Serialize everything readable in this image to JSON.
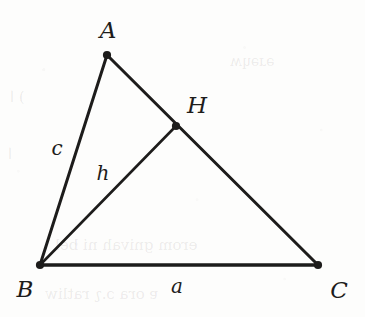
{
  "figure": {
    "kind": "geometry-diagram",
    "background_color": "#fdfdfc",
    "ink_color": "#1d1c1b",
    "width": 365,
    "height": 317
  },
  "points": {
    "A": {
      "label": "A",
      "x": 107,
      "y": 55,
      "label_x": 108,
      "label_y": 30
    },
    "B": {
      "label": "B",
      "x": 40,
      "y": 265,
      "label_x": 25,
      "label_y": 289
    },
    "C": {
      "label": "C",
      "x": 318,
      "y": 265,
      "label_x": 339,
      "label_y": 290
    },
    "H": {
      "label": "H",
      "x": 176,
      "y": 126,
      "label_x": 197,
      "label_y": 105
    }
  },
  "segments": [
    {
      "name": "AB",
      "from": "A",
      "to": "B"
    },
    {
      "name": "AC",
      "from": "A",
      "to": "C"
    },
    {
      "name": "BC",
      "from": "B",
      "to": "C"
    },
    {
      "name": "BH",
      "from": "B",
      "to": "H"
    }
  ],
  "side_labels": {
    "c": {
      "label": "c",
      "x": 57,
      "y": 148
    },
    "h": {
      "label": "h",
      "x": 103,
      "y": 173
    },
    "a": {
      "label": "a",
      "x": 177,
      "y": 286
    }
  },
  "ghost_text": [
    {
      "text": ") ا",
      "x": 10,
      "y": 95,
      "size": 15
    },
    {
      "text": "ا",
      "x": 8,
      "y": 152,
      "size": 15
    },
    {
      "text": "erom gnivah ni bel",
      "x": 55,
      "y": 243,
      "size": 15
    },
    {
      "text": "ɐ ora ɔ.ʅ ratliw",
      "x": 45,
      "y": 292,
      "size": 15
    },
    {
      "text": "ǝɹǝɥʍ",
      "x": 230,
      "y": 60,
      "size": 14
    }
  ]
}
